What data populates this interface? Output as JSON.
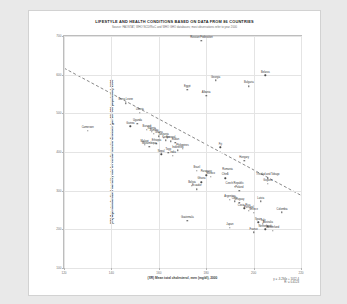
{
  "chart_data": {
    "type": "scatter",
    "title": "LIFESTYLE AND HEALTH CONDITIONS BASED ON DATA FROM 86 COUNTRIES",
    "subtitle": "Source: FAOSTAT, WHO NCD/RisC and WHO GHO databases; most observations refer to year 2000",
    "xlabel": "(XR) Mean total cholesterol, men (mg/dl), 2000",
    "ylabel": "(XN) Age-standardized mortality rate for cardiovascular diseases (per 100 000 population), 2000",
    "xlim": [
      120,
      220
    ],
    "ylim": [
      100,
      700
    ],
    "xticks": [
      120,
      140,
      160,
      180,
      200,
      220
    ],
    "yticks": [
      100,
      200,
      300,
      400,
      500,
      600,
      700
    ],
    "grid": true,
    "legend": "none",
    "trendline": {
      "style": "dashed",
      "equation": "y = -3.294x + 1012.4",
      "r2": "R² = 0.4123",
      "x_start": 120,
      "y_start": 617,
      "x_end": 220,
      "y_end": 288
    },
    "points": [
      {
        "name": "Russian Federation",
        "x": 178,
        "y": 688
      },
      {
        "name": "Belarus",
        "x": 205,
        "y": 598
      },
      {
        "name": "Georgia",
        "x": 184,
        "y": 585
      },
      {
        "name": "Bulgaria",
        "x": 198,
        "y": 570
      },
      {
        "name": "Egypt",
        "x": 172,
        "y": 561
      },
      {
        "name": "Albania",
        "x": 180,
        "y": 545
      },
      {
        "name": "Sierra Leone",
        "x": 146,
        "y": 526
      },
      {
        "name": "Liberia",
        "x": 152,
        "y": 502
      },
      {
        "name": "Cameroon",
        "x": 130,
        "y": 455
      },
      {
        "name": "Uganda",
        "x": 151,
        "y": 473
      },
      {
        "name": "Guinea",
        "x": 148,
        "y": 466
      },
      {
        "name": "Burundi",
        "x": 155,
        "y": 458
      },
      {
        "name": "Nigeria",
        "x": 157,
        "y": 452
      },
      {
        "name": "Zambia",
        "x": 158,
        "y": 447
      },
      {
        "name": "Ghana",
        "x": 160,
        "y": 441
      },
      {
        "name": "Tanzania",
        "x": 162,
        "y": 436
      },
      {
        "name": "Kenya",
        "x": 163,
        "y": 430
      },
      {
        "name": "Senegal",
        "x": 165,
        "y": 428
      },
      {
        "name": "Sudan",
        "x": 167,
        "y": 424
      },
      {
        "name": "Ethiopia",
        "x": 159,
        "y": 421
      },
      {
        "name": "Malawi",
        "x": 154,
        "y": 418
      },
      {
        "name": "Mozambique",
        "x": 156,
        "y": 414
      },
      {
        "name": "Fiji",
        "x": 186,
        "y": 412
      },
      {
        "name": "Philippines",
        "x": 170,
        "y": 408
      },
      {
        "name": "Indonesia",
        "x": 168,
        "y": 404
      },
      {
        "name": "Togo",
        "x": 164,
        "y": 398
      },
      {
        "name": "Nepal",
        "x": 161,
        "y": 394
      },
      {
        "name": "India",
        "x": 166,
        "y": 390
      },
      {
        "name": "Hungary",
        "x": 196,
        "y": 378
      },
      {
        "name": "Brazil",
        "x": 176,
        "y": 352
      },
      {
        "name": "Paraguay",
        "x": 180,
        "y": 340
      },
      {
        "name": "Mexico",
        "x": 182,
        "y": 336
      },
      {
        "name": "Romania",
        "x": 189,
        "y": 346
      },
      {
        "name": "China",
        "x": 188,
        "y": 332
      },
      {
        "name": "Trinidad and Tobago",
        "x": 206,
        "y": 332
      },
      {
        "name": "Guyana",
        "x": 206,
        "y": 318
      },
      {
        "name": "Ghana",
        "x": 178,
        "y": 322
      },
      {
        "name": "Bolivia",
        "x": 174,
        "y": 312
      },
      {
        "name": "Ecuador",
        "x": 176,
        "y": 304
      },
      {
        "name": "Czech Republic",
        "x": 192,
        "y": 310
      },
      {
        "name": "Poland",
        "x": 194,
        "y": 300
      },
      {
        "name": "Argentina",
        "x": 190,
        "y": 276
      },
      {
        "name": "Chile",
        "x": 192,
        "y": 272
      },
      {
        "name": "Uruguay",
        "x": 194,
        "y": 268
      },
      {
        "name": "Latvia",
        "x": 203,
        "y": 272
      },
      {
        "name": "Colombia",
        "x": 212,
        "y": 244
      },
      {
        "name": "Costa Rica",
        "x": 196,
        "y": 254
      },
      {
        "name": "Portugal",
        "x": 198,
        "y": 248
      },
      {
        "name": "Greece",
        "x": 200,
        "y": 242
      },
      {
        "name": "Guatemala",
        "x": 172,
        "y": 222
      },
      {
        "name": "Spain",
        "x": 202,
        "y": 218
      },
      {
        "name": "Italy",
        "x": 204,
        "y": 214
      },
      {
        "name": "Australia",
        "x": 206,
        "y": 208
      },
      {
        "name": "Japan",
        "x": 190,
        "y": 204
      },
      {
        "name": "France",
        "x": 200,
        "y": 192
      },
      {
        "name": "Switzerland",
        "x": 208,
        "y": 196
      },
      {
        "name": "Netherlands",
        "x": 205,
        "y": 200
      }
    ]
  }
}
